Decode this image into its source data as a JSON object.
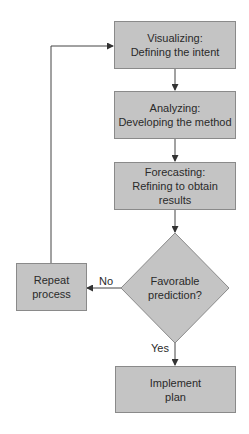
{
  "diagram": {
    "type": "flowchart",
    "nodes": {
      "visualizing": {
        "line1": "Visualizing:",
        "line2": "Defining the intent"
      },
      "analyzing": {
        "line1": "Analyzing:",
        "line2": "Developing the method"
      },
      "forecasting": {
        "line1": "Forecasting:",
        "line2": "Refining to obtain",
        "line3": "results"
      },
      "decision": {
        "line1": "Favorable",
        "line2": "prediction?"
      },
      "repeat": {
        "line1": "Repeat",
        "line2": "process"
      },
      "implement": {
        "line1": "Implement",
        "line2": "plan"
      }
    },
    "edge_labels": {
      "no": "No",
      "yes": "Yes"
    },
    "colors": {
      "fill": "#c4c4c4",
      "stroke": "#8a8a8a",
      "line": "#444444",
      "text": "#2a2a2a"
    }
  }
}
